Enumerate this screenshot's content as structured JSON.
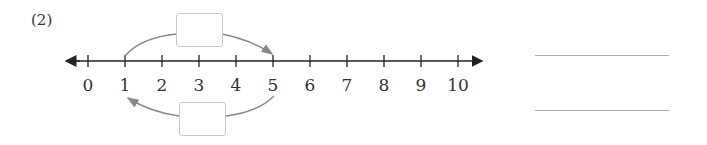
{
  "problem_label": "(2)",
  "number_line": {
    "ticks": [
      "0",
      "1",
      "2",
      "3",
      "4",
      "5",
      "6",
      "7",
      "8",
      "9",
      "10"
    ],
    "line_color": "#222222",
    "arrow_color": "#888888"
  },
  "jumps": [
    {
      "from": 1,
      "to": 5,
      "position": "above",
      "box_value": ""
    },
    {
      "from": 5,
      "to": 1,
      "position": "below",
      "box_value": ""
    }
  ],
  "answer_lines": [
    {
      "value": ""
    },
    {
      "value": ""
    }
  ]
}
